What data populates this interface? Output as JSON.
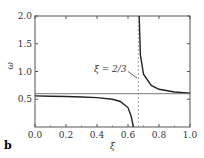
{
  "panel_label": "b",
  "chart_data": {
    "type": "line",
    "title": "",
    "xlabel": "ξ",
    "ylabel": "ω_cl",
    "xlim": [
      0.0,
      1.0
    ],
    "ylim": [
      0.0,
      2.0
    ],
    "x_ticks": [
      "0.0",
      "0.2",
      "0.4",
      "0.6",
      "0.8",
      "1.0"
    ],
    "y_ticks": [
      "0.5",
      "1.0",
      "1.5",
      "2.0"
    ],
    "grid": false,
    "annotation": {
      "text": "ξ = 2/3",
      "x": 0.6667
    },
    "series": [
      {
        "name": "branch-left",
        "x": [
          0.0,
          0.1,
          0.2,
          0.3,
          0.4,
          0.5,
          0.55,
          0.6,
          0.62,
          0.635
        ],
        "y": [
          0.56,
          0.555,
          0.55,
          0.54,
          0.53,
          0.5,
          0.46,
          0.35,
          0.2,
          0.0
        ]
      },
      {
        "name": "branch-right",
        "x": [
          0.672,
          0.68,
          0.7,
          0.75,
          0.8,
          0.9,
          1.0
        ],
        "y": [
          2.0,
          1.3,
          0.95,
          0.75,
          0.68,
          0.63,
          0.61
        ]
      },
      {
        "name": "asymptote-horizontal",
        "x": [
          0.0,
          1.0
        ],
        "y": [
          0.6,
          0.6
        ]
      },
      {
        "name": "asymptote-vertical",
        "x": [
          0.6667,
          0.6667
        ],
        "y": [
          0.0,
          2.0
        ]
      }
    ]
  }
}
